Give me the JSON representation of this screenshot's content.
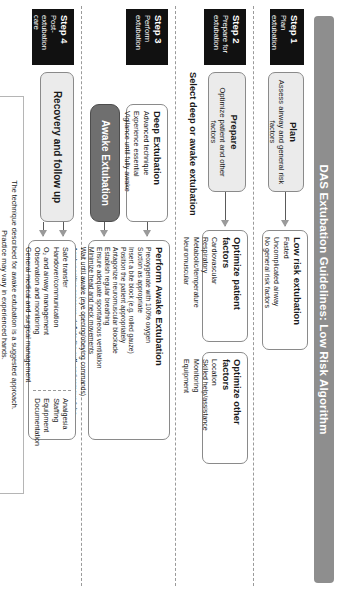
{
  "title": "DAS Extubation Guidelines: Low Risk Algorithm",
  "steps": [
    {
      "num": "Step 1",
      "text": "Plan extubation"
    },
    {
      "num": "Step 2",
      "text": "Prepare for extubation"
    },
    {
      "num": "Step 3",
      "text": "Perform extubation"
    },
    {
      "num": "Step 4",
      "text": "Post-extubation care"
    }
  ],
  "plan": {
    "title": "Plan",
    "subtitle": "Assess airway and general risk factors"
  },
  "low_risk": {
    "title": "Low risk extubation",
    "items": [
      "Fasted",
      "Uncomplicated airway",
      "No general risk factors"
    ]
  },
  "prepare": {
    "title": "Prepare",
    "subtitle": "Optimize patient and other factors"
  },
  "optimize_patient": {
    "title": "Optimize patient factors",
    "items": [
      "Cardiovascular",
      "Respiratory",
      "Metabolic/temperature",
      "Neuromuscular"
    ]
  },
  "optimize_other": {
    "title": "Optimize other factors",
    "items": [
      "Location",
      "Skilled help/assistance",
      "Monitoring",
      "Equipment"
    ]
  },
  "select_label": "Select deep or awake extubation",
  "deep": {
    "title": "Deep Extubation",
    "items": [
      "Advanced technique",
      "Experience essential",
      "Vigilance until fully awake"
    ]
  },
  "awake": {
    "title": "Awake Extubation"
  },
  "awake_detail": {
    "title": "Perform Awake Extubation",
    "items": [
      "Preoxygenate with 100% oxygen",
      "Suction as appropriate",
      "Insert a bite block (e.g. rolled gauze)",
      "Position the patient appropriately",
      "Antagonize neuromuscular blockade",
      "Establish regular breathing",
      "Ensure adequate spontaneous ventilation",
      "Minimize head and neck movements",
      "Wait until awake (eye opening/obeying commands)",
      "Apply positive pressure, deflate the cuff, and remove tube",
      "Provide 100% oxygen",
      "Check airway patency and adequacy of breathing",
      "Continue oxygen supplementation"
    ]
  },
  "recovery": {
    "title": "Recovery and follow up"
  },
  "followup": {
    "col_a": [
      "Safe transfer",
      "Handover/communication",
      "O₂ and airway management",
      "Observation and monitoring",
      "General medical and surgical management"
    ],
    "col_b": [
      "Analgesia",
      "Staffing",
      "Equipment",
      "Documentation"
    ]
  },
  "footnote": {
    "line1": "The technique described for awake extubation is a suggested approach.",
    "line2": "Practice may vary in experienced hands."
  },
  "colors": {
    "title_bar": "#8e8e8e",
    "step_block": "#111111",
    "awake_block": "#6f6f6f",
    "box_fill": "#ebebeb"
  }
}
